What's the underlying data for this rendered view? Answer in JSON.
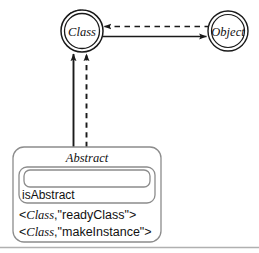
{
  "diagram": {
    "type": "uml-metamodel-diagram",
    "background_color": "#ffffff",
    "line_color": "#1a1a1a",
    "box_border_color": "#8c8c8c",
    "rule_color": "#b0b0b0",
    "nodes": [
      {
        "id": "class-node",
        "label": "Class",
        "shape": "double-circle",
        "cx": 82,
        "cy": 31,
        "r_outer": 21,
        "r_inner": 17
      },
      {
        "id": "object-node",
        "label": "Object",
        "shape": "double-circle",
        "cx": 228,
        "cy": 31,
        "r_outer": 20,
        "r_inner": 16
      }
    ],
    "edges": [
      {
        "id": "self-loop",
        "style": "dashed",
        "from": "class-node",
        "to": "class-node",
        "arrowhead": "filled",
        "direction": "clockwise-left"
      },
      {
        "id": "object-to-class",
        "style": "dashed",
        "from": "object-node",
        "to": "class-node",
        "arrowhead": "filled",
        "direction": "left"
      },
      {
        "id": "class-to-object",
        "style": "solid",
        "from": "class-node",
        "to": "object-node",
        "arrowhead": "filled",
        "direction": "right"
      },
      {
        "id": "abstract-to-class-solid",
        "style": "solid",
        "from": "abstract-box",
        "to": "class-node",
        "arrowhead": "filled",
        "direction": "up"
      },
      {
        "id": "abstract-to-class-dashed",
        "style": "dashed",
        "from": "abstract-box",
        "to": "class-node",
        "arrowhead": "filled",
        "direction": "up"
      }
    ],
    "box": {
      "id": "abstract-box",
      "title": "Abstract",
      "slot_value": "",
      "attribute": "isAbstract",
      "pairs": [
        {
          "left": "Class",
          "right": "\"readyClass\""
        },
        {
          "left": "Class",
          "right": "\"makeInstance\""
        }
      ],
      "pair_open": "<",
      "pair_comma": ",",
      "pair_close": ">"
    }
  }
}
